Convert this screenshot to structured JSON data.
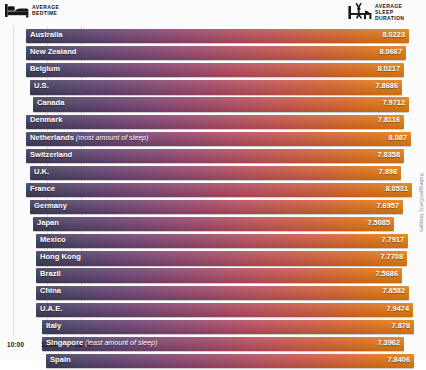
{
  "header": {
    "left": {
      "icon": "bed-icon",
      "line1": "AVERAGE",
      "line2": "BEDTIME"
    },
    "right": {
      "icon": "person-stretching-waking-icon",
      "line1": "AVERAGE",
      "line2": "SLEEP",
      "line3": "DURATION"
    }
  },
  "axis": {
    "ticks": [
      "10:00",
      "11:00",
      "12:00"
    ],
    "tick_x": [
      7,
      41,
      75
    ]
  },
  "credit": "hubegger/Getty Images",
  "colors": {
    "gradient_start": "#3e3a55",
    "gradient_mid": "#b64c5c",
    "gradient_end": "#e07c10",
    "background": "#fbfbfc",
    "gridline": "#dcdde1",
    "text_on_bar": "#ffffff",
    "axis_text": "#1b1c20"
  },
  "chart_data": {
    "type": "bar",
    "xlabel": "Bedtime",
    "ylabel": "Country",
    "value_label": "Average Sleep Duration (hours)",
    "xlim": [
      "10:00",
      "12:30"
    ],
    "grid": true,
    "legend": "none",
    "categories": [
      "Australia",
      "New Zealand",
      "Belgium",
      "U.S.",
      "Canada",
      "Denmark",
      "Netherlands",
      "Switzerland",
      "U.K.",
      "France",
      "Germany",
      "Japan",
      "Mexico",
      "Hong Kong",
      "Brazil",
      "China",
      "U.A.E.",
      "Italy",
      "Singapore",
      "Spain"
    ],
    "values": [
      8.0223,
      8.0667,
      8.0217,
      7.8686,
      7.9712,
      7.8116,
      8.087,
      7.8358,
      7.898,
      8.0531,
      7.6957,
      7.5085,
      7.7917,
      7.7708,
      7.5686,
      7.8582,
      7.9474,
      7.878,
      7.3962,
      7.8406
    ],
    "rows": [
      {
        "country": "Australia",
        "note": "",
        "value": "8.0223",
        "value_num": 8.0223,
        "bar_left": 26,
        "bar_right": 409
      },
      {
        "country": "New Zealand",
        "note": "",
        "value": "8.0667",
        "value_num": 8.0667,
        "bar_left": 26,
        "bar_right": 406
      },
      {
        "country": "Belgium",
        "note": "",
        "value": "8.0217",
        "value_num": 8.0217,
        "bar_left": 26,
        "bar_right": 404
      },
      {
        "country": "U.S.",
        "note": "",
        "value": "7.8686",
        "value_num": 7.8686,
        "bar_left": 30,
        "bar_right": 402
      },
      {
        "country": "Canada",
        "note": "",
        "value": "7.9712",
        "value_num": 7.9712,
        "bar_left": 33,
        "bar_right": 409
      },
      {
        "country": "Denmark",
        "note": "",
        "value": "7.8116",
        "value_num": 7.8116,
        "bar_left": 26,
        "bar_right": 404
      },
      {
        "country": "Netherlands",
        "note": "(most amount of sleep)",
        "value": "8.087",
        "value_num": 8.087,
        "bar_left": 26,
        "bar_right": 411
      },
      {
        "country": "Switzerland",
        "note": "",
        "value": "7.8358",
        "value_num": 7.8358,
        "bar_left": 26,
        "bar_right": 404
      },
      {
        "country": "U.K.",
        "note": "",
        "value": "7.898",
        "value_num": 7.898,
        "bar_left": 30,
        "bar_right": 401
      },
      {
        "country": "France",
        "note": "",
        "value": "8.0531",
        "value_num": 8.0531,
        "bar_left": 26,
        "bar_right": 412
      },
      {
        "country": "Germany",
        "note": "",
        "value": "7.6957",
        "value_num": 7.6957,
        "bar_left": 30,
        "bar_right": 403
      },
      {
        "country": "Japan",
        "note": "",
        "value": "7.5085",
        "value_num": 7.5085,
        "bar_left": 33,
        "bar_right": 394
      },
      {
        "country": "Mexico",
        "note": "",
        "value": "7.7917",
        "value_num": 7.7917,
        "bar_left": 36,
        "bar_right": 408
      },
      {
        "country": "Hong Kong",
        "note": "",
        "value": "7.7708",
        "value_num": 7.7708,
        "bar_left": 36,
        "bar_right": 407
      },
      {
        "country": "Brazil",
        "note": "",
        "value": "7.5686",
        "value_num": 7.5686,
        "bar_left": 36,
        "bar_right": 402
      },
      {
        "country": "China",
        "note": "",
        "value": "7.8582",
        "value_num": 7.8582,
        "bar_left": 36,
        "bar_right": 409
      },
      {
        "country": "U.A.E.",
        "note": "",
        "value": "7.9474",
        "value_num": 7.9474,
        "bar_left": 36,
        "bar_right": 413
      },
      {
        "country": "Italy",
        "note": "",
        "value": "7.878",
        "value_num": 7.878,
        "bar_left": 42,
        "bar_right": 414
      },
      {
        "country": "Singapore",
        "note": "(least amount of sleep)",
        "value": "7.3962",
        "value_num": 7.3962,
        "bar_left": 42,
        "bar_right": 404
      },
      {
        "country": "Spain",
        "note": "",
        "value": "7.8406",
        "value_num": 7.8406,
        "bar_left": 46,
        "bar_right": 414
      }
    ],
    "gridlines_x": [
      13,
      47,
      81
    ]
  }
}
